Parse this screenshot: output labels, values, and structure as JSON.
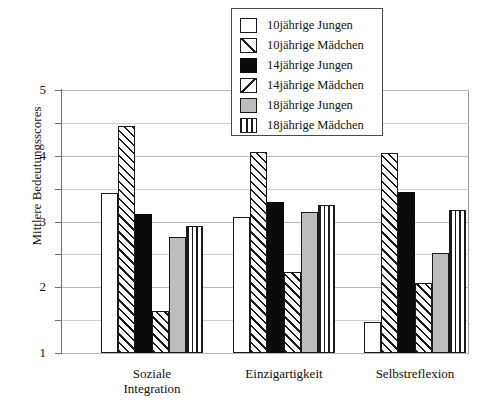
{
  "chart_data": {
    "type": "bar",
    "title": "",
    "xlabel": "",
    "ylabel": "Mittlere Bedeutungsscores",
    "categories": [
      "Soziale Integration",
      "Einzigartigkeit",
      "Selbstreflexion"
    ],
    "category_lines": [
      [
        "Soziale",
        "Integration"
      ],
      [
        "Einzigartigkeit"
      ],
      [
        "Selbstreflexion"
      ]
    ],
    "ylim": [
      1,
      5
    ],
    "yticks": [
      1,
      2,
      3,
      4,
      5
    ],
    "yticklabels": [
      "1",
      "2",
      "3",
      "4",
      "5"
    ],
    "minor_ticks": [
      1.5,
      2.5,
      3.5,
      4.5
    ],
    "grid": true,
    "legend_position": "top-center",
    "series": [
      {
        "name": "10jährige Jungen",
        "pattern": "white",
        "values": [
          3.43,
          3.07,
          1.47
        ]
      },
      {
        "name": "10jährige Mädchen",
        "pattern": "diagonal-up",
        "values": [
          4.46,
          4.05,
          4.04
        ]
      },
      {
        "name": "14jährige Jungen",
        "pattern": "solid-black",
        "values": [
          3.11,
          3.3,
          3.45
        ]
      },
      {
        "name": "14jährige Mädchen",
        "pattern": "diagonal-down",
        "values": [
          1.64,
          2.23,
          2.06
        ]
      },
      {
        "name": "18jährige Jungen",
        "pattern": "grey",
        "values": [
          2.76,
          3.14,
          2.52
        ]
      },
      {
        "name": "18jährige Mädchen",
        "pattern": "vertical",
        "values": [
          2.93,
          3.25,
          3.17
        ]
      }
    ]
  },
  "legend": {
    "items": [
      {
        "label": "10jährige Jungen",
        "swatch": "white-swatch"
      },
      {
        "label": "10jährige Mädchen",
        "swatch": "diagonal-up-swatch"
      },
      {
        "label": "14jährige Jungen",
        "swatch": "black-swatch"
      },
      {
        "label": "14jährige Mädchen",
        "swatch": "diagonal-down-swatch"
      },
      {
        "label": "18jährige Jungen",
        "swatch": "grey-swatch"
      },
      {
        "label": "18jährige Mädchen",
        "swatch": "vertical-swatch"
      }
    ]
  },
  "colors": {
    "axis": "#6f6f6f",
    "grid_major": "#b9b9b9",
    "grid_minor": "#cfcfcf",
    "bar_outline": "#1b1b1b",
    "fill_black": "#0b0b0b",
    "fill_grey": "#bdbdbd",
    "fill_white": "#ffffff",
    "background": "#ffffff"
  }
}
